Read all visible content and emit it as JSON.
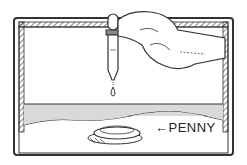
{
  "illustration": {
    "subject": "eyedropper dripping water onto a penny in a tray",
    "label_text": "←PENNY"
  },
  "colors": {
    "line": "#333333",
    "water": "#d9d9d9",
    "background": "#ffffff"
  }
}
